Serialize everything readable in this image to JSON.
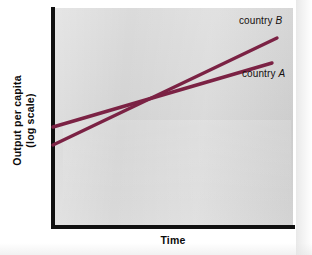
{
  "chart_data": {
    "type": "line",
    "title": "",
    "subtitle": "",
    "xlabel": "Time",
    "ylabel": "Output per capita\n(log scale)",
    "ylabel_line1": "Output per capita",
    "ylabel_line2": "(log scale)",
    "grid": false,
    "legend_position": "inline-right-end-of-line",
    "axis_ticks": {
      "x": [],
      "y": []
    },
    "xlim": [
      0,
      100
    ],
    "ylim": [
      0,
      100
    ],
    "annotations": [
      {
        "text": "crossing point",
        "x": 39,
        "y": 59,
        "visible": false
      }
    ],
    "series": [
      {
        "name": "country A",
        "label_text": "country",
        "label_letter": "A",
        "color": "#7B2244",
        "x": [
          0,
          100
        ],
        "y": [
          45,
          75
        ],
        "slope_desc": "flatter",
        "start_pixel": [
          53,
          127
        ],
        "end_pixel": [
          272,
          63
        ]
      },
      {
        "name": "country B",
        "label_text": "country",
        "label_letter": "B",
        "color": "#7B2244",
        "x": [
          0,
          100
        ],
        "y": [
          37,
          86
        ],
        "slope_desc": "steeper",
        "start_pixel": [
          53,
          145
        ],
        "end_pixel": [
          277,
          38
        ]
      }
    ],
    "crossing_point": {
      "x_pixel": 147,
      "y_pixel": 98
    },
    "colors": {
      "line": "#7B2244",
      "panel_background": "#D6D6D6",
      "axis": "#101010",
      "text": "#0B0B0B",
      "page_background": "#FFFFFF"
    }
  }
}
